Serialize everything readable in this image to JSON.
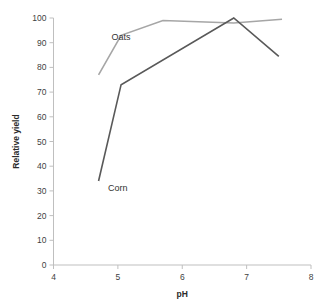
{
  "chart_data": {
    "type": "line",
    "title": "",
    "xlabel": "pH",
    "ylabel": "Relative yield",
    "xlim": [
      4,
      8
    ],
    "ylim": [
      0,
      100
    ],
    "xticks": [
      "4",
      "5",
      "6",
      "7",
      "8"
    ],
    "yticks": [
      "0",
      "10",
      "20",
      "30",
      "40",
      "50",
      "60",
      "70",
      "80",
      "90",
      "100"
    ],
    "grid": false,
    "legend_position": "inline-annotations",
    "series": [
      {
        "name": "Oats",
        "color": "#a6a6a6",
        "points": [
          [
            4.7,
            77
          ],
          [
            5.05,
            93
          ],
          [
            5.7,
            99
          ],
          [
            6.8,
            98
          ],
          [
            7.55,
            99.5
          ]
        ]
      },
      {
        "name": "Corn",
        "color": "#595959",
        "points": [
          [
            4.7,
            34
          ],
          [
            5.05,
            73
          ],
          [
            6.8,
            100
          ],
          [
            7.5,
            84.5
          ]
        ]
      }
    ],
    "annotations": [
      {
        "text": "Oats",
        "x": 5.05,
        "y": 91
      },
      {
        "text": "Corn",
        "x": 5.0,
        "y": 30
      }
    ]
  }
}
